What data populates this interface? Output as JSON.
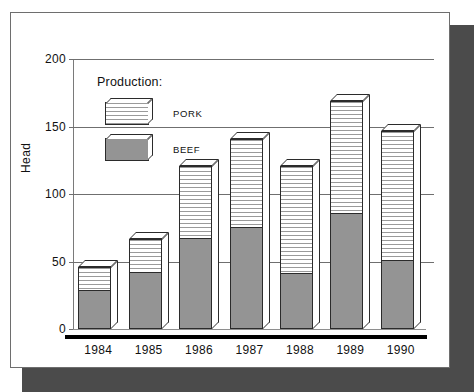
{
  "chart_data": {
    "type": "bar",
    "subtype": "stacked-3d-column",
    "title": "",
    "xlabel": "",
    "ylabel": "Head",
    "ylim": [
      0,
      200
    ],
    "yticks": [
      0,
      50,
      100,
      150,
      200
    ],
    "ytick_labels": [
      "0",
      "50",
      "100",
      "150",
      "200"
    ],
    "grid": true,
    "grid_axis": "y",
    "legend": {
      "title": "Production:",
      "position": "inside-top-left",
      "entries": [
        {
          "name": "PORK",
          "pattern": "horizontal-lines",
          "color": "#ffffff"
        },
        {
          "name": "BEEF",
          "pattern": "solid",
          "color": "#949494"
        }
      ]
    },
    "categories": [
      "1984",
      "1985",
      "1986",
      "1987",
      "1988",
      "1989",
      "1990"
    ],
    "series": [
      {
        "name": "BEEF",
        "values": [
          30,
          43,
          68,
          76,
          42,
          87,
          52
        ]
      },
      {
        "name": "PORK",
        "values": [
          16,
          24,
          53,
          65,
          79,
          82,
          95
        ]
      }
    ],
    "totals": [
      46,
      67,
      121,
      141,
      121,
      169,
      147
    ]
  },
  "style": {
    "beef_color": "#949494",
    "pork_color": "#ffffff",
    "outline_color": "#2b2b2b",
    "grid_color": "#6f6f6f",
    "shadow_color": "#4b4b4b",
    "card_background": "#ffffff"
  }
}
